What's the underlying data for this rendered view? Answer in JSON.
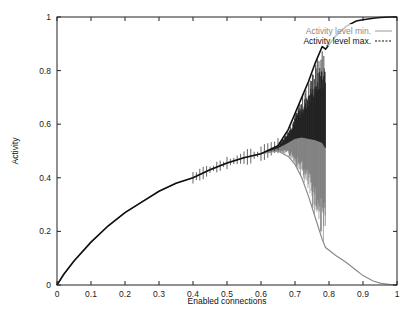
{
  "chart_data": {
    "type": "line",
    "title": "",
    "xlabel": "Enabled connections",
    "ylabel": "Activity",
    "xlim": [
      0,
      1
    ],
    "ylim": [
      0,
      1
    ],
    "grid": false,
    "legend_position": "top-right (inside)",
    "x_ticks": [
      "0",
      "0.1",
      "0.2",
      "0.3",
      "0.4",
      "0.5",
      "0.6",
      "0.7",
      "0.8",
      "0.9",
      "1"
    ],
    "y_ticks": [
      "0",
      "0.2",
      "0.4",
      "0.6",
      "0.8",
      "1"
    ],
    "series": [
      {
        "name": "Activity level min.",
        "style": "solid thin gray",
        "color": "#8a8a8a",
        "x": [
          0,
          0.02,
          0.05,
          0.1,
          0.15,
          0.2,
          0.25,
          0.3,
          0.35,
          0.4,
          0.45,
          0.5,
          0.55,
          0.6,
          0.65,
          0.68,
          0.7,
          0.72,
          0.74,
          0.76,
          0.78,
          0.79,
          0.82,
          0.85,
          0.88,
          0.9,
          0.93,
          0.95,
          0.98,
          1.0
        ],
        "values": [
          0,
          0.04,
          0.09,
          0.16,
          0.22,
          0.27,
          0.31,
          0.35,
          0.38,
          0.4,
          0.43,
          0.455,
          0.475,
          0.49,
          0.5,
          0.48,
          0.45,
          0.4,
          0.33,
          0.25,
          0.17,
          0.14,
          0.11,
          0.085,
          0.055,
          0.035,
          0.015,
          0.007,
          0.002,
          0
        ]
      },
      {
        "name": "Activity level max.",
        "style": "dashed dark",
        "color": "#111111",
        "x": [
          0,
          0.02,
          0.05,
          0.1,
          0.15,
          0.2,
          0.25,
          0.3,
          0.35,
          0.4,
          0.45,
          0.5,
          0.55,
          0.6,
          0.65,
          0.68,
          0.7,
          0.72,
          0.74,
          0.76,
          0.78,
          0.79,
          0.82,
          0.85,
          0.88,
          0.9,
          0.93,
          0.95,
          0.98,
          1.0
        ],
        "values": [
          0,
          0.04,
          0.09,
          0.16,
          0.22,
          0.27,
          0.31,
          0.35,
          0.38,
          0.4,
          0.43,
          0.455,
          0.475,
          0.49,
          0.52,
          0.58,
          0.64,
          0.7,
          0.76,
          0.83,
          0.89,
          0.88,
          0.93,
          0.965,
          0.985,
          0.99,
          0.995,
          0.998,
          1.0,
          1.0
        ]
      }
    ],
    "annotations": [
      "Noisy oscillation band between x≈0.65 and x≈0.79 where min and max diverge"
    ]
  },
  "legend": {
    "min_label": "Activity level min.",
    "max_label": "Activity level max."
  },
  "axes": {
    "xlabel": "Enabled connections",
    "ylabel": "Activity"
  }
}
